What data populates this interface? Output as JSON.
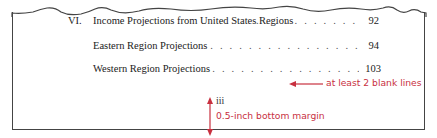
{
  "toc": {
    "entries": [
      {
        "number": "VI.",
        "title": "Income Projections from United States Regions",
        "page": "92"
      },
      {
        "number": "",
        "title": "Eastern Region Projections",
        "page": "94"
      },
      {
        "number": "",
        "title": "Western Region Projections",
        "page": "103"
      }
    ],
    "page_numeral": "iii"
  },
  "annotations": {
    "blank_lines": "at least 2 blank lines",
    "bottom_margin": "0.5-inch bottom margin"
  },
  "colors": {
    "annotation": "#c8303f",
    "border": "#444444",
    "text": "#222222"
  }
}
